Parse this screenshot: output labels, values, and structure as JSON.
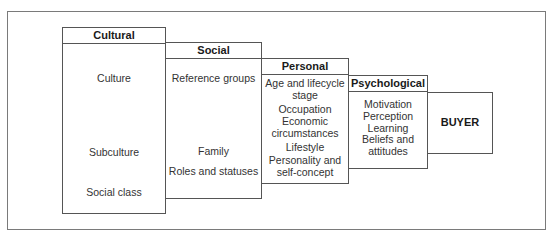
{
  "diagram": {
    "type": "nested-factor-boxes",
    "groups": [
      {
        "header": "Cultural",
        "items": [
          "Culture",
          "Subculture",
          "Social class"
        ]
      },
      {
        "header": "Social",
        "items": [
          "Reference groups",
          "Family",
          "Roles and statuses"
        ]
      },
      {
        "header": "Personal",
        "items": [
          "Age and lifecycle stage",
          "Occupation",
          "Economic circumstances",
          "Lifestyle",
          "Personality and self-concept"
        ]
      },
      {
        "header": "Psychological",
        "items": [
          "Motivation",
          "Perception",
          "Learning",
          "Beliefs and attitudes"
        ]
      }
    ],
    "target": "BUYER"
  },
  "labels": {
    "cultural": {
      "header": "Cultural",
      "i0": "Culture",
      "i1": "Subculture",
      "i2": "Social class"
    },
    "social": {
      "header": "Social",
      "i0": "Reference groups",
      "i1": "Family",
      "i2": "Roles and statuses"
    },
    "personal": {
      "header": "Personal",
      "i0a": "Age and lifecycle",
      "i0b": "stage",
      "i1": "Occupation",
      "i2a": "Economic",
      "i2b": "circumstances",
      "i3": "Lifestyle",
      "i4a": "Personality and",
      "i4b": "self-concept"
    },
    "psychological": {
      "header": "Psychological",
      "i0": "Motivation",
      "i1": "Perception",
      "i2": "Learning",
      "i3a": "Beliefs and",
      "i3b": "attitudes"
    },
    "buyer": "BUYER"
  }
}
